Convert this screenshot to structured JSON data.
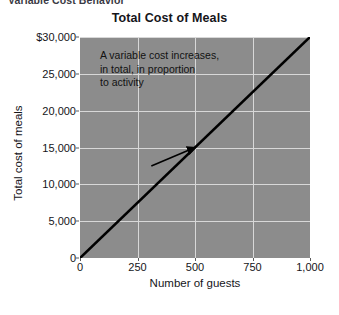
{
  "clipped_caption": "Variable Cost Behavior",
  "chart_data": {
    "type": "line",
    "title": "Total Cost of Meals",
    "xlabel": "Number of guests",
    "ylabel": "Total cost of meals",
    "x": [
      0,
      1000
    ],
    "values": [
      0,
      30000
    ],
    "series": [
      {
        "name": "Total cost of meals",
        "x": [
          0,
          1000
        ],
        "values": [
          0,
          30000
        ],
        "color": "#000000"
      }
    ],
    "xlim": [
      0,
      1000
    ],
    "ylim": [
      0,
      30000
    ],
    "xticks": [
      0,
      250,
      500,
      750,
      1000
    ],
    "yticks": [
      0,
      5000,
      10000,
      15000,
      20000,
      25000,
      30000
    ],
    "xtick_labels": [
      "0",
      "250",
      "500",
      "750",
      "1,000"
    ],
    "ytick_labels": [
      "0",
      "5,000",
      "10,000",
      "15,000",
      "20,000",
      "25,000",
      "$30,000"
    ],
    "grid": true,
    "legend": false,
    "plot_background": "#8c8c8c",
    "gridline_color": "#d8d8d8",
    "annotations": [
      {
        "text": "A variable cost increases,\nin total, in proportion\nto activity",
        "arrow": true,
        "arrow_from_x": 310,
        "arrow_from_y": 12500,
        "arrow_to_x": 500,
        "arrow_to_y": 15000
      }
    ]
  }
}
